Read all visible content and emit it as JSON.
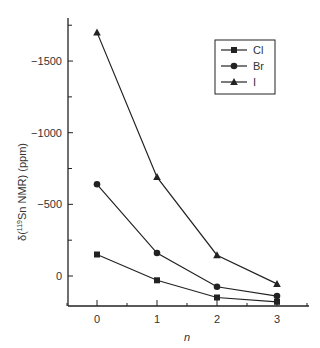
{
  "chart_data": {
    "type": "line",
    "title": "",
    "xlabel": "n",
    "ylabel": "δ(119Sn NMR)  (ppm)",
    "ylabel_parts": {
      "prefix": "δ(",
      "superscript": "119",
      "suffix": "Sn NMR)",
      "unit": "(ppm)"
    },
    "x": [
      0,
      1,
      2,
      3
    ],
    "x_ticks": [
      "0",
      "1",
      "2",
      "3"
    ],
    "y_ticks": [
      "-1500",
      "-1000",
      "-500",
      "0"
    ],
    "y_tick_values": [
      -1500,
      -1000,
      -500,
      0
    ],
    "y_axis_inverted": true,
    "ylim": [
      200,
      -1780
    ],
    "xlim": [
      -0.5,
      3.5
    ],
    "grid": false,
    "legend_position": "upper right",
    "series": [
      {
        "name": "Cl",
        "marker": "square",
        "values": [
          -150,
          30,
          150,
          180
        ]
      },
      {
        "name": "Br",
        "marker": "circle",
        "values": [
          -640,
          -160,
          75,
          140
        ]
      },
      {
        "name": "I",
        "marker": "triangle",
        "values": [
          -1700,
          -690,
          -145,
          55
        ]
      }
    ]
  },
  "legend": {
    "items": [
      "Cl",
      "Br",
      "I"
    ]
  }
}
